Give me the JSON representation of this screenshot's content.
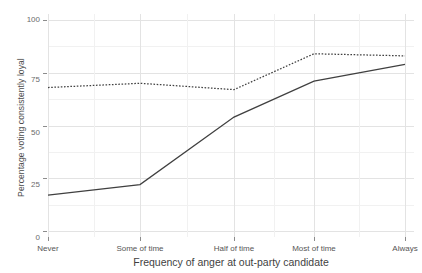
{
  "chart_data": {
    "type": "line",
    "title": "",
    "xlabel": "Frequency of anger at out-party candidate",
    "ylabel": "Percentage voting consistently loyal",
    "categories": [
      "Never",
      "Some of time",
      "Half of time",
      "Most of time",
      "Always"
    ],
    "ylim": [
      0,
      100
    ],
    "yticks": [
      0,
      25,
      50,
      75,
      100
    ],
    "ytick_labels": [
      "0",
      "25",
      "50",
      "75",
      "100"
    ],
    "grid": true,
    "legend": "none",
    "series": [
      {
        "name": "solid-line",
        "style": "solid",
        "color": "#404040",
        "values": [
          17,
          22,
          54,
          71,
          79
        ]
      },
      {
        "name": "dotted-line",
        "style": "dotted",
        "color": "#404040",
        "values": [
          68,
          70,
          67,
          84,
          83
        ]
      }
    ]
  },
  "axis": {
    "y_title": "Percentage voting consistently loyal",
    "x_title": "Frequency of anger at out-party candidate",
    "y_tick_0": "0",
    "y_tick_25": "25",
    "y_tick_50": "50",
    "y_tick_75": "75",
    "y_tick_100": "100",
    "x_tick_1": "Never",
    "x_tick_2": "Some of time",
    "x_tick_3": "Half of time",
    "x_tick_4": "Most of time",
    "x_tick_5": "Always"
  }
}
